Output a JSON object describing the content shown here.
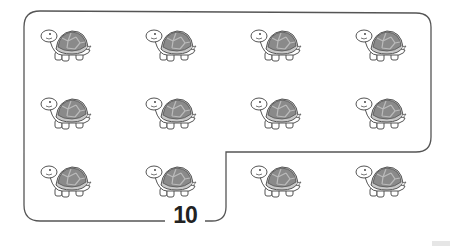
{
  "worksheet": {
    "group_label": "10",
    "item_name": "turtle",
    "total_items": 12,
    "rows": [
      [
        "turtle",
        "turtle",
        "turtle",
        "turtle"
      ],
      [
        "turtle",
        "turtle",
        "turtle",
        "turtle"
      ],
      [
        "turtle",
        "turtle",
        "turtle",
        "turtle"
      ]
    ],
    "circled_count": 10
  },
  "colors": {
    "shell": "#8a8a8a",
    "shell_rim": "#c8c8c8",
    "outline": "#555555"
  }
}
